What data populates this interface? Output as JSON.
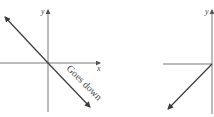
{
  "diagrams": [
    {
      "name": "left-graph",
      "x_axis_label": "x",
      "y_axis_label": "y",
      "annotation": "Goes down",
      "line": "negative slope through origin, arrows both ends"
    },
    {
      "name": "right-graph",
      "y_axis_label": "y",
      "line": "ray from origin down-left with arrow"
    }
  ],
  "colors": {
    "line": "#3a3a3a",
    "axis": "#555555",
    "background": "#ffffff"
  }
}
